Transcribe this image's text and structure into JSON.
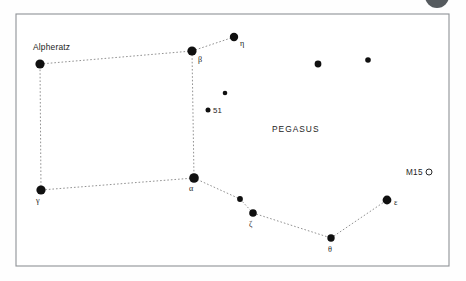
{
  "figure": {
    "kind": "star-chart",
    "width": 466,
    "height": 281,
    "background_color": "#fdfdfd",
    "frame": {
      "x": 16,
      "y": 14,
      "width": 433,
      "height": 252,
      "stroke_color": "#8e9296",
      "fill_color": "#ffffff"
    },
    "corner_blob": {
      "cx": 437,
      "cy": -4,
      "r": 12,
      "color": "#555a5e"
    },
    "constellation_label": "PEGASUS",
    "constellation_label_pos": {
      "x": 272,
      "y": 132
    }
  },
  "chart_data": {
    "type": "scatter",
    "title": "PEGASUS",
    "xlabel": "",
    "ylabel": "",
    "xlim": [
      16,
      449
    ],
    "ylim": [
      14,
      266
    ],
    "grid": false,
    "legend": "none",
    "star_color": "#101010",
    "line_color": "#8c8c8c",
    "stars": [
      {
        "id": "alpheratz",
        "label": "Alpheratz",
        "label_type": "proper",
        "x": 40,
        "y": 64,
        "r": 4.6,
        "label_x": 33,
        "label_y": 50,
        "anchor": "start"
      },
      {
        "id": "beta",
        "label": "β",
        "label_type": "greek",
        "x": 192,
        "y": 51,
        "r": 4.6,
        "label_x": 198,
        "label_y": 62,
        "anchor": "start"
      },
      {
        "id": "eta",
        "label": "η",
        "label_type": "greek",
        "x": 234,
        "y": 37,
        "r": 4.2,
        "label_x": 240,
        "label_y": 46,
        "anchor": "start"
      },
      {
        "id": "alpha",
        "label": "α",
        "label_type": "greek",
        "x": 194,
        "y": 178,
        "r": 4.8,
        "label_x": 189,
        "label_y": 191,
        "anchor": "start"
      },
      {
        "id": "gamma",
        "label": "γ",
        "label_type": "greek",
        "x": 41,
        "y": 190,
        "r": 4.6,
        "label_x": 36,
        "label_y": 203,
        "anchor": "start"
      },
      {
        "id": "zeta",
        "label": "ζ",
        "label_type": "greek",
        "x": 253,
        "y": 213,
        "r": 3.8,
        "label_x": 249,
        "label_y": 227,
        "anchor": "start"
      },
      {
        "id": "theta",
        "label": "θ",
        "label_type": "greek",
        "x": 331,
        "y": 238,
        "r": 3.7,
        "label_x": 328,
        "label_y": 252,
        "anchor": "start"
      },
      {
        "id": "epsilon",
        "label": "ε",
        "label_type": "greek",
        "x": 387,
        "y": 200,
        "r": 4.4,
        "label_x": 394,
        "label_y": 205,
        "anchor": "start"
      },
      {
        "id": "51-pegasi",
        "label": "51",
        "label_type": "flamsteed",
        "x": 208,
        "y": 110,
        "r": 2.5,
        "label_x": 213,
        "label_y": 113,
        "anchor": "start"
      },
      {
        "id": "unlabeled-upper-1",
        "label": "",
        "label_type": "none",
        "x": 225,
        "y": 93,
        "r": 2.3,
        "label_x": 0,
        "label_y": 0,
        "anchor": "start"
      },
      {
        "id": "unlabeled-upper-2",
        "label": "",
        "label_type": "none",
        "x": 318,
        "y": 64,
        "r": 3.4,
        "label_x": 0,
        "label_y": 0,
        "anchor": "start"
      },
      {
        "id": "unlabeled-upper-3",
        "label": "",
        "label_type": "none",
        "x": 368,
        "y": 60,
        "r": 2.8,
        "label_x": 0,
        "label_y": 0,
        "anchor": "start"
      },
      {
        "id": "unlabeled-lower-1",
        "label": "",
        "label_type": "none",
        "x": 240,
        "y": 199,
        "r": 2.9,
        "label_x": 0,
        "label_y": 0,
        "anchor": "start"
      }
    ],
    "deep_sky_objects": [
      {
        "id": "m15",
        "label": "M15",
        "symbol": "open-circle",
        "label_x": 406,
        "label_y": 175,
        "symbol_cx": 429,
        "symbol_cy": 172,
        "symbol_r": 3.0
      }
    ],
    "lines": [
      {
        "from": "alpheratz",
        "to": "beta"
      },
      {
        "from": "beta",
        "to": "eta"
      },
      {
        "from": "beta",
        "to": "alpha"
      },
      {
        "from": "alpha",
        "to": "gamma"
      },
      {
        "from": "gamma",
        "to": "alpheratz"
      },
      {
        "from": "alpha",
        "to": "unlabeled-lower-1"
      },
      {
        "from": "unlabeled-lower-1",
        "to": "zeta"
      },
      {
        "from": "zeta",
        "to": "theta"
      },
      {
        "from": "theta",
        "to": "epsilon"
      }
    ]
  }
}
